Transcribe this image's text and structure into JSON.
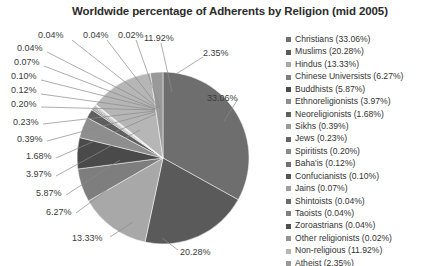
{
  "chart_data": {
    "type": "pie",
    "title": "Worldwide percentage of Adherents by Religion (mid 2005)",
    "xlabel": "",
    "ylabel": "",
    "legend_position": "right",
    "grid": false,
    "start_angle_deg": 0,
    "direction": "clockwise",
    "categories": [
      "Christians",
      "Muslims",
      "Hindus",
      "Chinese Universists",
      "Buddhists",
      "Ethnoreligionists",
      "Neoreligionists",
      "Sikhs",
      "Jews",
      "Spiritists",
      "Baha'is",
      "Confucianists",
      "Jains",
      "Shintoists",
      "Taoists",
      "Zoroastrians",
      "Other religionists",
      "Non-religious",
      "Atheist"
    ],
    "values": [
      33.06,
      20.28,
      13.33,
      6.27,
      5.87,
      3.97,
      1.68,
      0.39,
      0.23,
      0.2,
      0.12,
      0.1,
      0.07,
      0.04,
      0.04,
      0.04,
      0.02,
      11.92,
      2.35
    ],
    "value_labels": [
      "33.06%",
      "20.28%",
      "13.33%",
      "6.27%",
      "5.87%",
      "3.97%",
      "1.68%",
      "0.39%",
      "0.23%",
      "0.20%",
      "0.12%",
      "0.10%",
      "0.07%",
      "0.04%",
      "0.04%",
      "0.04%",
      "0.02%",
      "11.92%",
      "2.35%"
    ],
    "colors": [
      "#6e6e6e",
      "#5a5a5a",
      "#a8a8a8",
      "#7e7e7e",
      "#4a4a4a",
      "#8e8e8e",
      "#5f5f5f",
      "#9b9b9b",
      "#636363",
      "#8a8a8a",
      "#707070",
      "#565656",
      "#9f9f9f",
      "#6a6a6a",
      "#808080",
      "#4f4f4f",
      "#949494",
      "#b6b6b6",
      "#999999"
    ]
  },
  "legend": {
    "entries": [
      {
        "label": "Christians (33.06%)",
        "color": "#6e6e6e"
      },
      {
        "label": "Muslims (20.28%)",
        "color": "#5a5a5a"
      },
      {
        "label": "Hindus (13.33%)",
        "color": "#a8a8a8"
      },
      {
        "label": "Chinese Universists (6.27%)",
        "color": "#7e7e7e"
      },
      {
        "label": "Buddhists (5.87%)",
        "color": "#4a4a4a"
      },
      {
        "label": "Ethnoreligionists (3.97%)",
        "color": "#8e8e8e"
      },
      {
        "label": "Neoreligionists (1.68%)",
        "color": "#5f5f5f"
      },
      {
        "label": "Sikhs (0.39%)",
        "color": "#9b9b9b"
      },
      {
        "label": "Jews (0.23%)",
        "color": "#636363"
      },
      {
        "label": "Spiritists (0.20%)",
        "color": "#8a8a8a"
      },
      {
        "label": "Baha'is (0.12%)",
        "color": "#707070"
      },
      {
        "label": "Confucianists (0.10%)",
        "color": "#565656"
      },
      {
        "label": "Jains (0.07%)",
        "color": "#9f9f9f"
      },
      {
        "label": "Shintoists (0.04%)",
        "color": "#6a6a6a"
      },
      {
        "label": "Taoists (0.04%)",
        "color": "#808080"
      },
      {
        "label": "Zoroastrians (0.04%)",
        "color": "#4f4f4f"
      },
      {
        "label": "Other religionists (0.02%)",
        "color": "#949494"
      },
      {
        "label": "Non-religious (11.92%)",
        "color": "#b6b6b6"
      },
      {
        "label": "Atheist (2.35%)",
        "color": "#999999"
      }
    ]
  },
  "callouts": [
    {
      "text": "0.04%",
      "x": 38,
      "y": 31,
      "lx": 72,
      "ly": 40,
      "tx": 158,
      "ty": 108
    },
    {
      "text": "0.04%",
      "x": 83,
      "y": 31,
      "lx": 107,
      "ly": 40,
      "tx": 159,
      "ty": 108
    },
    {
      "text": "0.02%",
      "x": 118,
      "y": 31,
      "lx": 136,
      "ly": 40,
      "tx": 160,
      "ty": 108
    },
    {
      "text": "11.92%",
      "x": 144,
      "y": 34,
      "lx": 161,
      "ly": 43,
      "tx": 172,
      "ty": 92
    },
    {
      "text": "2.35%",
      "x": 203,
      "y": 49,
      "lx": 203,
      "ly": 57,
      "tx": 176,
      "ty": 74
    },
    {
      "text": "33.06%",
      "x": 207,
      "y": 94,
      "lx": 238,
      "ly": 99,
      "tx": 224,
      "ty": 121
    },
    {
      "text": "0.04%",
      "x": 17,
      "y": 44,
      "lx": 47,
      "ly": 52,
      "tx": 157,
      "ty": 108
    },
    {
      "text": "0.07%",
      "x": 14,
      "y": 58,
      "lx": 44,
      "ly": 66,
      "tx": 156,
      "ty": 109
    },
    {
      "text": "0.10%",
      "x": 11,
      "y": 72,
      "lx": 41,
      "ly": 80,
      "tx": 156,
      "ty": 109
    },
    {
      "text": "0.12%",
      "x": 11,
      "y": 86,
      "lx": 41,
      "ly": 94,
      "tx": 155,
      "ty": 110
    },
    {
      "text": "0.20%",
      "x": 11,
      "y": 100,
      "lx": 41,
      "ly": 107,
      "tx": 155,
      "ty": 110
    },
    {
      "text": "0.23%",
      "x": 13,
      "y": 118,
      "lx": 43,
      "ly": 124,
      "tx": 155,
      "ty": 111
    },
    {
      "text": "0.39%",
      "x": 17,
      "y": 135,
      "lx": 47,
      "ly": 141,
      "tx": 155,
      "ty": 112
    },
    {
      "text": "1.68%",
      "x": 26,
      "y": 152,
      "lx": 56,
      "ly": 158,
      "tx": 156,
      "ty": 114
    },
    {
      "text": "3.97%",
      "x": 26,
      "y": 170,
      "lx": 56,
      "ly": 176,
      "tx": 140,
      "ty": 130
    },
    {
      "text": "5.87%",
      "x": 36,
      "y": 189,
      "lx": 66,
      "ly": 195,
      "tx": 120,
      "ty": 160
    },
    {
      "text": "6.27%",
      "x": 46,
      "y": 208,
      "lx": 76,
      "ly": 213,
      "tx": 107,
      "ty": 190
    },
    {
      "text": "13.33%",
      "x": 72,
      "y": 234,
      "lx": 110,
      "ly": 237,
      "tx": 133,
      "ty": 222
    },
    {
      "text": "20.28%",
      "x": 180,
      "y": 248,
      "lx": 178,
      "ly": 250,
      "tx": 162,
      "ty": 238
    }
  ]
}
